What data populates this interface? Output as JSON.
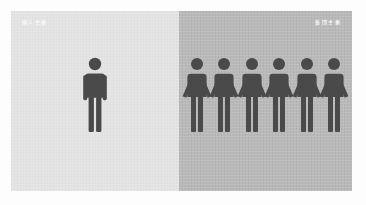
{
  "image": {
    "title": "Individual versus group pictogram illustration",
    "width": 366,
    "height": 205,
    "background": "#ffffff"
  },
  "panels": {
    "left": {
      "name": "individual-panel",
      "caption": "個人主義",
      "caption_align": "left",
      "background_color": "#e3e3e3",
      "figure_color": "#4a4a4a",
      "figure_count": 1,
      "figures_joined": false
    },
    "right": {
      "name": "collective-panel",
      "caption": "集団主義",
      "caption_align": "right",
      "background_color": "#b6b6b6",
      "figure_color": "#4a4a4a",
      "figure_count": 6,
      "figures_joined": true
    }
  },
  "icons": {
    "person_standing": "person-standing-icon",
    "person_holding_hands": "person-holding-hands-icon"
  }
}
